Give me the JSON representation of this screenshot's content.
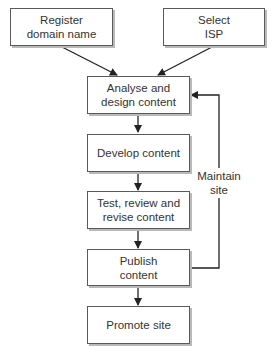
{
  "diagram": {
    "type": "flowchart",
    "nodes": [
      {
        "id": "register",
        "label": "Register\ndomain name"
      },
      {
        "id": "isp",
        "label": "Select\nISP"
      },
      {
        "id": "analyse",
        "label": "Analyse and\ndesign content"
      },
      {
        "id": "develop",
        "label": "Develop content"
      },
      {
        "id": "test",
        "label": "Test, review and\nrevise content"
      },
      {
        "id": "publish",
        "label": "Publish\ncontent"
      },
      {
        "id": "promote",
        "label": "Promote site"
      }
    ],
    "edges": [
      {
        "from": "register",
        "to": "analyse"
      },
      {
        "from": "isp",
        "to": "analyse"
      },
      {
        "from": "analyse",
        "to": "develop"
      },
      {
        "from": "develop",
        "to": "test"
      },
      {
        "from": "test",
        "to": "publish"
      },
      {
        "from": "publish",
        "to": "promote"
      },
      {
        "from": "publish",
        "to": "analyse",
        "label": "Maintain\nsite"
      }
    ],
    "feedback_label": "Maintain\nsite",
    "colors": {
      "box_border": "#5a5a5a",
      "box_shadow": "#b9b9b9",
      "arrow": "#222222",
      "text": "#333333"
    }
  }
}
